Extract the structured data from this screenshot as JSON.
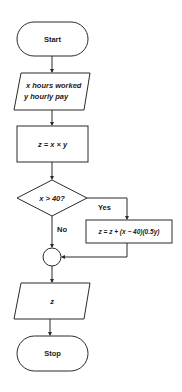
{
  "flowchart": {
    "start": {
      "label": "Start"
    },
    "input": {
      "line1": "x hours worked",
      "line2": "y hourly pay"
    },
    "compute": {
      "label": "z = x × y"
    },
    "decision": {
      "label": "x > 40?",
      "yes_label": "Yes",
      "no_label": "No"
    },
    "overtime": {
      "label": "z = z + (x − 40)(0.5y)"
    },
    "connector": {
      "label": ""
    },
    "output": {
      "label": "z"
    },
    "stop": {
      "label": "Stop"
    }
  }
}
